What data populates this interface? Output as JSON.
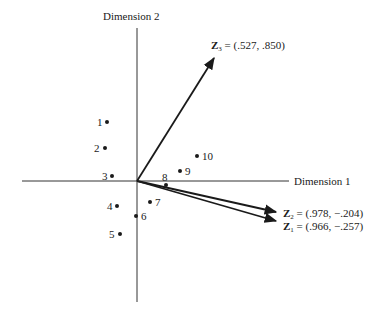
{
  "axes": {
    "x_label": "Dimension 1",
    "y_label": "Dimension 2"
  },
  "vectors": [
    {
      "id": "Z3",
      "name": "Z",
      "sub": "3",
      "value_text": " = (.527, .850)",
      "x": 0.527,
      "y": 0.85
    },
    {
      "id": "Z2",
      "name": "Z",
      "sub": "2",
      "value_text": " = (.978, −.204)",
      "x": 0.978,
      "y": -0.204
    },
    {
      "id": "Z1",
      "name": "Z",
      "sub": "1",
      "value_text": " = (.966, −.257)",
      "x": 0.966,
      "y": -0.257
    }
  ],
  "points": [
    {
      "label": "1"
    },
    {
      "label": "2"
    },
    {
      "label": "3"
    },
    {
      "label": "4"
    },
    {
      "label": "5"
    },
    {
      "label": "6"
    },
    {
      "label": "7"
    },
    {
      "label": "8"
    },
    {
      "label": "9"
    },
    {
      "label": "10"
    }
  ],
  "colors": {
    "ink": "#1a1a1a",
    "axis": "#333333",
    "background": "#ffffff"
  }
}
